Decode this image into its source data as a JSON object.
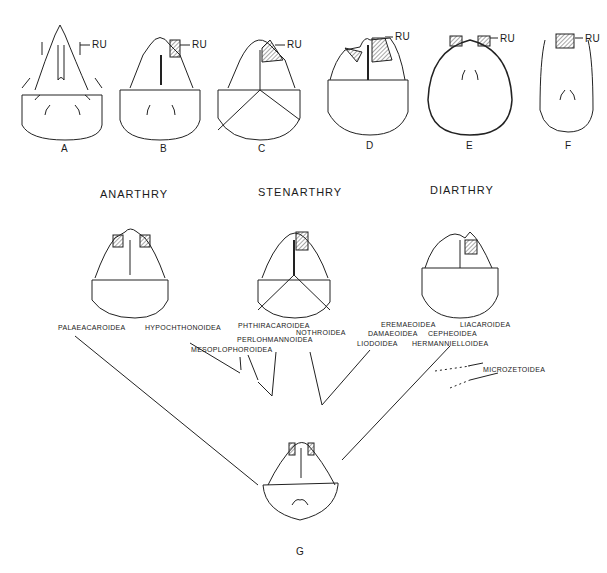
{
  "top_row": {
    "label_ru": "RU",
    "figures": [
      {
        "id": "A",
        "label": "A"
      },
      {
        "id": "B",
        "label": "B"
      },
      {
        "id": "C",
        "label": "C"
      },
      {
        "id": "D",
        "label": "D"
      },
      {
        "id": "E",
        "label": "E"
      },
      {
        "id": "F",
        "label": "F"
      }
    ]
  },
  "groups": [
    {
      "id": "anarthry",
      "title": "ANARTHRY"
    },
    {
      "id": "stenarthry",
      "title": "STENARTHRY"
    },
    {
      "id": "diarthry",
      "title": "DIARTHRY"
    }
  ],
  "taxa": {
    "palaeacaroidea": "PALAEACAROIDEA",
    "hypochthonoidea": "HYPOCHTHONOIDEA",
    "mesoplophoroidea": "MESOPLOPHOROIDEA",
    "phthiracaroidea": "PHTHIRACAROIDEA",
    "perlohmannoidea": "PERLOHMANNOIDEA",
    "nothroidea": "NOTHROIDEA",
    "eremaeoidea": "EREMAEOIDEA",
    "liacaroidea": "LIACAROIDEA",
    "damaeoidea": "DAMAEOIDEA",
    "cepheoidea": "CEPHEOIDEA",
    "liodoidea": "LIODOIDEA",
    "hermannielloidea": "HERMANNIELLOIDEA",
    "microzetoidea": "MICROZETOIDEA"
  },
  "ancestor": {
    "id": "G",
    "label": "G"
  }
}
